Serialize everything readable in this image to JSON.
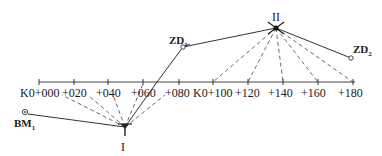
{
  "diagram": {
    "type": "survey-traverse-leveling",
    "baseline": {
      "y": 82,
      "x_start": 39,
      "x_end": 355,
      "stations": [
        {
          "label": "K0+000",
          "x": 39
        },
        {
          "label": "+020",
          "x": 74
        },
        {
          "label": "+040",
          "x": 108
        },
        {
          "label": "+060",
          "x": 143
        },
        {
          "label": "+080",
          "x": 179
        },
        {
          "label": "K0+100",
          "x": 213
        },
        {
          "label": "+120",
          "x": 248
        },
        {
          "label": "+140",
          "x": 283
        },
        {
          "label": "+160",
          "x": 318
        },
        {
          "label": "+180",
          "x": 353
        }
      ]
    },
    "points": {
      "instrument_1": {
        "label": "I",
        "x": 125,
        "y": 127
      },
      "instrument_2": {
        "label": "II",
        "x": 276,
        "y": 28
      },
      "zd1": {
        "label": "ZD",
        "sub": "1",
        "x": 183,
        "y": 47
      },
      "zd2": {
        "label": "ZD",
        "sub": "2",
        "x": 351,
        "y": 58
      },
      "bm1": {
        "label": "BM",
        "sub": "1",
        "x": 24,
        "y": 112
      }
    },
    "dashed_from_I": [
      "K0+000",
      "+020",
      "+040",
      "+060",
      "+080"
    ],
    "dashed_from_II": [
      "K0+100",
      "+120",
      "+140",
      "+160",
      "+180"
    ]
  },
  "labels": {
    "I": "I",
    "II": "II",
    "zd1_main": "ZD",
    "zd1_sub": "1",
    "zd2_main": "ZD",
    "zd2_sub": "2",
    "bm1_main": "BM",
    "bm1_sub": "1",
    "s0": "K0+000",
    "s1": "+020",
    "s2": "+040",
    "s3": "+060",
    "s4": "+080",
    "s5": "K0+100",
    "s6": "+120",
    "s7": "+140",
    "s8": "+160",
    "s9": "+180"
  }
}
